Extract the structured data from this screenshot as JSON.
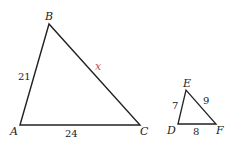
{
  "diagram": {
    "triangle_abc": {
      "vertices": {
        "A": "A",
        "B": "B",
        "C": "C"
      },
      "sides": {
        "AB": "21",
        "AC": "24",
        "BC": "x"
      }
    },
    "triangle_def": {
      "vertices": {
        "D": "D",
        "E": "E",
        "F": "F"
      },
      "sides": {
        "DE": "7",
        "DF": "8",
        "EF": "9"
      }
    },
    "colors": {
      "line": "#222222",
      "variable": "#c0504d"
    }
  }
}
